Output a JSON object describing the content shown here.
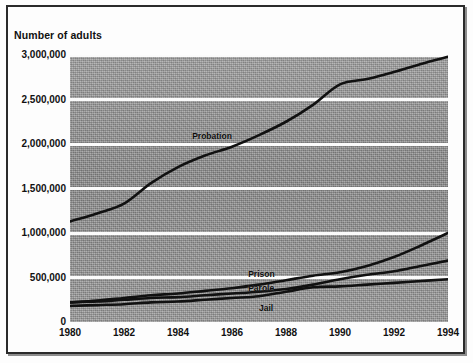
{
  "axis_title": "Number of adults",
  "series_labels": {
    "probation": "Probation",
    "prison": "Prison",
    "parole": "Parole",
    "jail": "Jail"
  },
  "colors": {
    "line": "#111111",
    "plot_background": "#9a9a9a",
    "gridline": "#fbfbfb",
    "frame": "#2b2b2b"
  },
  "chart_data": {
    "type": "line",
    "title": "",
    "xlabel": "",
    "ylabel": "Number of adults",
    "x": [
      1980,
      1981,
      1982,
      1983,
      1984,
      1985,
      1986,
      1987,
      1988,
      1989,
      1990,
      1991,
      1992,
      1993,
      1994
    ],
    "xlim": [
      1980,
      1994
    ],
    "ylim": [
      0,
      3000000
    ],
    "xticks": [
      1980,
      1982,
      1984,
      1986,
      1988,
      1990,
      1992,
      1994
    ],
    "xticklabels": [
      "1980",
      "1982",
      "1984",
      "1986",
      "1988",
      "1990",
      "1992",
      "1994"
    ],
    "yticks": [
      0,
      500000,
      1000000,
      1500000,
      2000000,
      2500000,
      3000000
    ],
    "yticklabels": [
      "0",
      "500,000",
      "1,000,000",
      "1,500,000",
      "2,000,000",
      "2,500,000",
      "3,000,000"
    ],
    "grid": true,
    "legend": "inline-labels",
    "series": [
      {
        "name": "Probation",
        "values": [
          1130000,
          1220000,
          1330000,
          1560000,
          1740000,
          1870000,
          1970000,
          2100000,
          2250000,
          2440000,
          2670000,
          2730000,
          2810000,
          2900000,
          2980000
        ]
      },
      {
        "name": "Prison",
        "values": [
          220000,
          240000,
          270000,
          300000,
          320000,
          350000,
          380000,
          420000,
          470000,
          520000,
          560000,
          630000,
          730000,
          860000,
          1000000
        ]
      },
      {
        "name": "Parole",
        "values": [
          220000,
          230000,
          250000,
          270000,
          280000,
          300000,
          320000,
          340000,
          370000,
          420000,
          480000,
          530000,
          570000,
          630000,
          690000
        ]
      },
      {
        "name": "Jail",
        "values": [
          180000,
          190000,
          200000,
          220000,
          230000,
          250000,
          270000,
          290000,
          340000,
          390000,
          400000,
          420000,
          440000,
          460000,
          480000
        ]
      }
    ]
  }
}
